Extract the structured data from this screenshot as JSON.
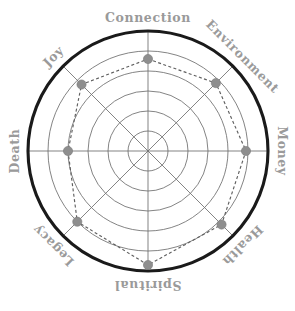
{
  "chart_data": {
    "type": "radar",
    "title": "",
    "subtitle": "",
    "xlabel": "",
    "ylabel": "",
    "categories": [
      "Connection",
      "Environment",
      "Money",
      "Health",
      "Spiritual",
      "Legacy",
      "Death",
      "Joy"
    ],
    "values": [
      4.6,
      4.8,
      4.9,
      5.2,
      5.7,
      5.0,
      4.0,
      4.7
    ],
    "series": [
      {
        "name": "",
        "values": [
          4.6,
          4.8,
          4.9,
          5.2,
          5.7,
          5.0,
          4.0,
          4.7
        ]
      }
    ],
    "rlim": [
      0,
      6
    ],
    "ring_count": 6,
    "grid": true,
    "legend": "none",
    "closed": true,
    "start_angle_deg": 90,
    "direction": "clockwise",
    "marker": "circle",
    "line_style": "dashed",
    "colors": {
      "outer_ring": "#1a1a1a",
      "grid": "#6e6e6e",
      "series_line": "#5f5f5f",
      "marker": "#8e8e8e",
      "label": "#9a9a9a",
      "background": "#ffffff"
    },
    "geometry": {
      "center_x": 148,
      "center_y": 151,
      "outer_radius": 120,
      "label_radius": 133
    },
    "axes": [
      {
        "label": "Connection",
        "angle_deg": 90,
        "value": 4.6,
        "label_rotation_deg": 0
      },
      {
        "label": "Environment",
        "angle_deg": 45,
        "value": 4.8,
        "label_rotation_deg": 45
      },
      {
        "label": "Money",
        "angle_deg": 0,
        "value": 4.9,
        "label_rotation_deg": 90
      },
      {
        "label": "Health",
        "angle_deg": -45,
        "value": 5.2,
        "label_rotation_deg": 135
      },
      {
        "label": "Spiritual",
        "angle_deg": -90,
        "value": 5.7,
        "label_rotation_deg": 180
      },
      {
        "label": "Legacy",
        "angle_deg": -135,
        "value": 5.0,
        "label_rotation_deg": 225
      },
      {
        "label": "Death",
        "angle_deg": 180,
        "value": 4.0,
        "label_rotation_deg": 270
      },
      {
        "label": "Joy",
        "angle_deg": 135,
        "value": 4.7,
        "label_rotation_deg": 315
      }
    ]
  }
}
